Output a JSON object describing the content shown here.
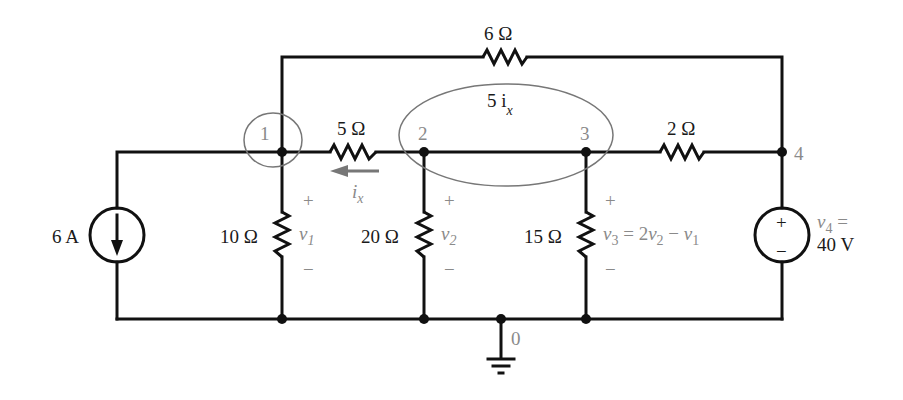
{
  "diagram": {
    "type": "circuit-schematic",
    "colors": {
      "wire": "#111111",
      "annotation": "#8a8a8a",
      "supernode_ring": "#777777"
    },
    "nodes": [
      {
        "id": "1",
        "label": "1"
      },
      {
        "id": "2",
        "label": "2"
      },
      {
        "id": "3",
        "label": "3"
      },
      {
        "id": "4",
        "label": "4"
      },
      {
        "id": "0",
        "label": "0",
        "ground": true
      }
    ],
    "components": {
      "r_top": {
        "label": "6 Ω",
        "between": [
          "1",
          "4"
        ]
      },
      "r_12": {
        "label": "5 Ω",
        "between": [
          "1",
          "2"
        ]
      },
      "r_34": {
        "label": "2 Ω",
        "between": [
          "3",
          "4"
        ]
      },
      "r_10": {
        "label": "10 Ω",
        "between": [
          "1",
          "0"
        ]
      },
      "r_20": {
        "label": "20 Ω",
        "between": [
          "2",
          "0"
        ]
      },
      "r_30": {
        "label": "15 Ω",
        "between": [
          "3",
          "0"
        ]
      },
      "isrc": {
        "label": "6 A",
        "direction": "down"
      },
      "vsrc": {
        "label_line1": "v",
        "label_sub": "4",
        "label_eq": " =",
        "label_line2": "40 V"
      }
    },
    "annotations": {
      "supernode_label": "5 i",
      "supernode_sub": "x",
      "current_label": "i",
      "current_sub": "x",
      "v1": {
        "var": "v",
        "sub": "1"
      },
      "v2": {
        "var": "v",
        "sub": "2"
      },
      "v3": {
        "var": "v",
        "sub": "3",
        "eq": " = 2",
        "v2": "v",
        "v2sub": "2",
        "minus": " − ",
        "v1": "v",
        "v1sub": "1"
      },
      "plus": "+",
      "minus": "−"
    }
  }
}
